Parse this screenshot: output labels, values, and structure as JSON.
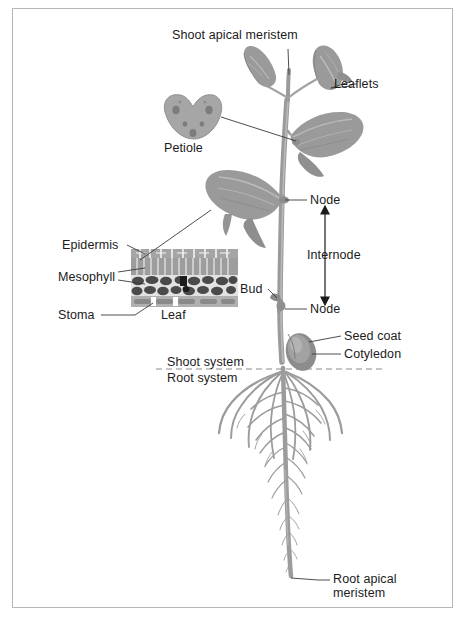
{
  "figure": {
    "background_color": "#ffffff",
    "frame_color": "#b6b6b6",
    "plant_color": "#9a9a9a",
    "plant_shadow_color": "#7d7d7d",
    "plant_highlight_color": "#c2c2c2",
    "leader_line_color": "#3a3a3a",
    "text_color": "#1b1b1b",
    "divider_color": "#8c8c8c"
  },
  "labels": {
    "shoot_apical_meristem": "Shoot apical meristem",
    "leaflets": "Leaflets",
    "petiole": "Petiole",
    "node_upper": "Node",
    "internode": "Internode",
    "node_lower": "Node",
    "bud": "Bud",
    "epidermis": "Epidermis",
    "mesophyll": "Mesophyll",
    "stoma": "Stoma",
    "leaf": "Leaf",
    "seed_coat": "Seed coat",
    "cotyledon": "Cotyledon",
    "shoot_system": "Shoot system",
    "root_system": "Root system",
    "root_apical_meristem": "Root apical meristem"
  },
  "structures": {
    "stem": "main-stem",
    "taproot": "taproot",
    "lateral_roots": "lateral-roots",
    "leaf_cross_section": "leaf-cross-section-inset",
    "petiole_cross_section": "petiole-cross-section-inset",
    "seed": "seed-coat-cotyledon"
  }
}
